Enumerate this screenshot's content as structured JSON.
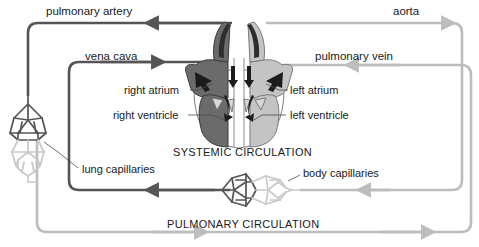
{
  "diagram": {
    "colors": {
      "deoxygenated": "#555555",
      "oxygenated": "#bdbdbd",
      "heart_right": "#6b6b6b",
      "heart_left": "#c4c4c4",
      "text": "#1a1a1a",
      "background": "#ffffff"
    },
    "vessel_labels": [
      {
        "id": "pulmonary-artery",
        "text": "pulmonary artery",
        "x": 46,
        "y": 6,
        "flow": "deoxygenated",
        "arrow": "left"
      },
      {
        "id": "aorta",
        "text": "aorta",
        "x": 393,
        "y": 6,
        "flow": "oxygenated",
        "arrow": "right"
      },
      {
        "id": "vena-cava",
        "text": "vena cava",
        "x": 85,
        "y": 51,
        "flow": "deoxygenated",
        "arrow": "right"
      },
      {
        "id": "pulmonary-vein",
        "text": "pulmonary vein",
        "x": 315,
        "y": 51,
        "flow": "oxygenated",
        "arrow": "left"
      }
    ],
    "chamber_labels": [
      {
        "id": "right-atrium",
        "text": "right atrium",
        "x": 124,
        "y": 89,
        "align": "right"
      },
      {
        "id": "left-atrium",
        "text": "left atrium",
        "x": 290,
        "y": 89,
        "align": "left"
      },
      {
        "id": "right-ventricle",
        "text": "right ventricle",
        "x": 113,
        "y": 112,
        "align": "right"
      },
      {
        "id": "left-ventricle",
        "text": "left ventricle",
        "x": 290,
        "y": 112,
        "align": "left"
      }
    ],
    "capillary_labels": [
      {
        "id": "lung-capillaries",
        "text": "lung capillaries",
        "x": 82,
        "y": 169
      },
      {
        "id": "body-capillaries",
        "text": "body capillaries",
        "x": 303,
        "y": 172
      }
    ],
    "circulation_labels": [
      {
        "id": "systemic-circulation",
        "text": "SYSTEMIC CIRCULATION",
        "x": 173,
        "y": 147
      },
      {
        "id": "pulmonary-circulation",
        "text": "PULMONARY CIRCULATION",
        "x": 167,
        "y": 219
      }
    ],
    "structures": [
      {
        "id": "heart",
        "name": "heart-cross-section"
      },
      {
        "id": "lung-capillary-bed",
        "name": "lung-capillary-network",
        "orientation": "vertical"
      },
      {
        "id": "body-capillary-bed",
        "name": "body-capillary-network",
        "orientation": "horizontal"
      }
    ]
  }
}
